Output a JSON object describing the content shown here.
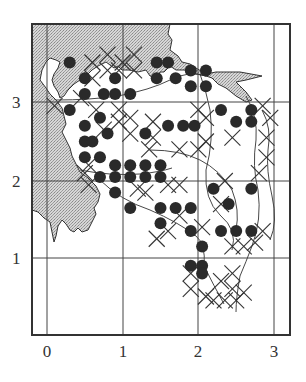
{
  "figure": {
    "type": "distribution-grid-map",
    "frame": {
      "left": 32,
      "top": 24,
      "right": 290,
      "bottom": 335
    },
    "grid": {
      "x_lines": [
        {
          "value": 0,
          "px": 47
        },
        {
          "value": 1,
          "px": 123
        },
        {
          "value": 2,
          "px": 198
        },
        {
          "value": 3,
          "px": 274
        }
      ],
      "y_lines": [
        {
          "value": 3,
          "px": 102
        },
        {
          "value": 2,
          "px": 181
        },
        {
          "value": 1,
          "px": 258
        }
      ]
    },
    "x_axis": {
      "ticks": [
        {
          "label": "0",
          "px": 47
        },
        {
          "label": "1",
          "px": 123
        },
        {
          "label": "2",
          "px": 198
        },
        {
          "label": "3",
          "px": 274
        }
      ]
    },
    "y_axis": {
      "ticks": [
        {
          "label": "3",
          "px": 102
        },
        {
          "label": "2",
          "px": 181
        },
        {
          "label": "1",
          "px": 258
        }
      ]
    },
    "colors": {
      "sea": "#c8c8c8",
      "land": "#ffffff",
      "ink": "#2a2a2a",
      "grid": "#444444"
    },
    "legend": {
      "dot": "filled circle = recorded occurrence",
      "cross": "cross = other record"
    }
  },
  "chart_data": {
    "type": "scatter",
    "title": "",
    "xlabel": "",
    "ylabel": "",
    "xlim": [
      -0.2,
      3.2
    ],
    "ylim": [
      0,
      4
    ],
    "grid": true,
    "x_ticks": [
      "0",
      "1",
      "2",
      "3"
    ],
    "y_ticks": [
      "1",
      "2",
      "3"
    ],
    "series": [
      {
        "name": "dots",
        "marker": "filled-circle",
        "points": [
          [
            0.3,
            3.5
          ],
          [
            0.5,
            3.3
          ],
          [
            0.5,
            3.1
          ],
          [
            0.75,
            3.1
          ],
          [
            0.9,
            3.3
          ],
          [
            0.9,
            3.1
          ],
          [
            1.1,
            3.1
          ],
          [
            1.45,
            3.5
          ],
          [
            1.6,
            3.5
          ],
          [
            1.45,
            3.3
          ],
          [
            1.7,
            3.3
          ],
          [
            1.9,
            3.4
          ],
          [
            2.1,
            3.4
          ],
          [
            1.9,
            3.2
          ],
          [
            2.1,
            3.2
          ],
          [
            0.3,
            2.9
          ],
          [
            0.5,
            2.7
          ],
          [
            0.7,
            2.8
          ],
          [
            0.5,
            2.5
          ],
          [
            0.6,
            2.5
          ],
          [
            0.8,
            2.6
          ],
          [
            0.5,
            2.3
          ],
          [
            0.7,
            2.3
          ],
          [
            1.3,
            2.6
          ],
          [
            1.6,
            2.7
          ],
          [
            1.8,
            2.7
          ],
          [
            1.95,
            2.7
          ],
          [
            2.3,
            2.9
          ],
          [
            2.5,
            2.75
          ],
          [
            2.7,
            2.9
          ],
          [
            2.7,
            2.75
          ],
          [
            0.9,
            2.2
          ],
          [
            1.1,
            2.2
          ],
          [
            1.3,
            2.2
          ],
          [
            1.5,
            2.2
          ],
          [
            0.7,
            2.05
          ],
          [
            0.9,
            2.05
          ],
          [
            1.1,
            2.05
          ],
          [
            1.3,
            2.05
          ],
          [
            1.5,
            2.05
          ],
          [
            0.9,
            1.85
          ],
          [
            1.1,
            1.65
          ],
          [
            1.5,
            1.65
          ],
          [
            1.7,
            1.65
          ],
          [
            1.9,
            1.65
          ],
          [
            2.2,
            1.9
          ],
          [
            2.7,
            1.9
          ],
          [
            2.4,
            1.7
          ],
          [
            1.5,
            1.45
          ],
          [
            1.9,
            1.35
          ],
          [
            2.3,
            1.35
          ],
          [
            2.5,
            1.35
          ],
          [
            2.7,
            1.35
          ],
          [
            2.05,
            1.15
          ],
          [
            1.9,
            0.9
          ],
          [
            2.05,
            0.9
          ],
          [
            2.05,
            0.8
          ]
        ]
      },
      {
        "name": "crosses",
        "marker": "x",
        "points": [
          [
            0.8,
            3.6
          ],
          [
            1.0,
            3.5
          ],
          [
            0.6,
            3.5
          ],
          [
            0.8,
            3.4
          ],
          [
            0.6,
            3.3
          ],
          [
            0.95,
            3.4
          ],
          [
            1.15,
            3.6
          ],
          [
            1.15,
            3.4
          ],
          [
            0.1,
            2.95
          ],
          [
            0.45,
            3.05
          ],
          [
            0.95,
            2.9
          ],
          [
            1.1,
            2.8
          ],
          [
            1.1,
            2.6
          ],
          [
            0.95,
            2.75
          ],
          [
            0.65,
            2.9
          ],
          [
            0.75,
            2.65
          ],
          [
            2.0,
            2.9
          ],
          [
            2.1,
            2.8
          ],
          [
            2.85,
            2.95
          ],
          [
            2.95,
            2.8
          ],
          [
            2.45,
            2.55
          ],
          [
            2.9,
            2.55
          ],
          [
            1.4,
            2.75
          ],
          [
            1.4,
            2.55
          ],
          [
            2.0,
            2.4
          ],
          [
            2.1,
            2.5
          ],
          [
            0.5,
            2.1
          ],
          [
            0.55,
            1.95
          ],
          [
            0.55,
            2.2
          ],
          [
            1.3,
            1.85
          ],
          [
            1.6,
            1.95
          ],
          [
            1.75,
            1.95
          ],
          [
            1.35,
            2.4
          ],
          [
            1.75,
            2.4
          ],
          [
            2.3,
            1.7
          ],
          [
            2.35,
            2.0
          ],
          [
            2.8,
            2.1
          ],
          [
            2.9,
            2.3
          ],
          [
            1.75,
            1.55
          ],
          [
            1.6,
            1.35
          ],
          [
            1.45,
            1.25
          ],
          [
            1.2,
            1.9
          ],
          [
            2.05,
            1.4
          ],
          [
            2.45,
            1.15
          ],
          [
            2.6,
            1.15
          ],
          [
            2.75,
            1.2
          ],
          [
            2.85,
            1.35
          ],
          [
            1.9,
            0.8
          ],
          [
            1.9,
            0.6
          ],
          [
            2.2,
            0.45
          ],
          [
            2.35,
            0.45
          ],
          [
            2.45,
            0.6
          ],
          [
            2.5,
            0.45
          ],
          [
            2.6,
            0.55
          ],
          [
            2.3,
            0.7
          ],
          [
            2.45,
            0.8
          ],
          [
            2.1,
            0.5
          ]
        ]
      }
    ]
  }
}
